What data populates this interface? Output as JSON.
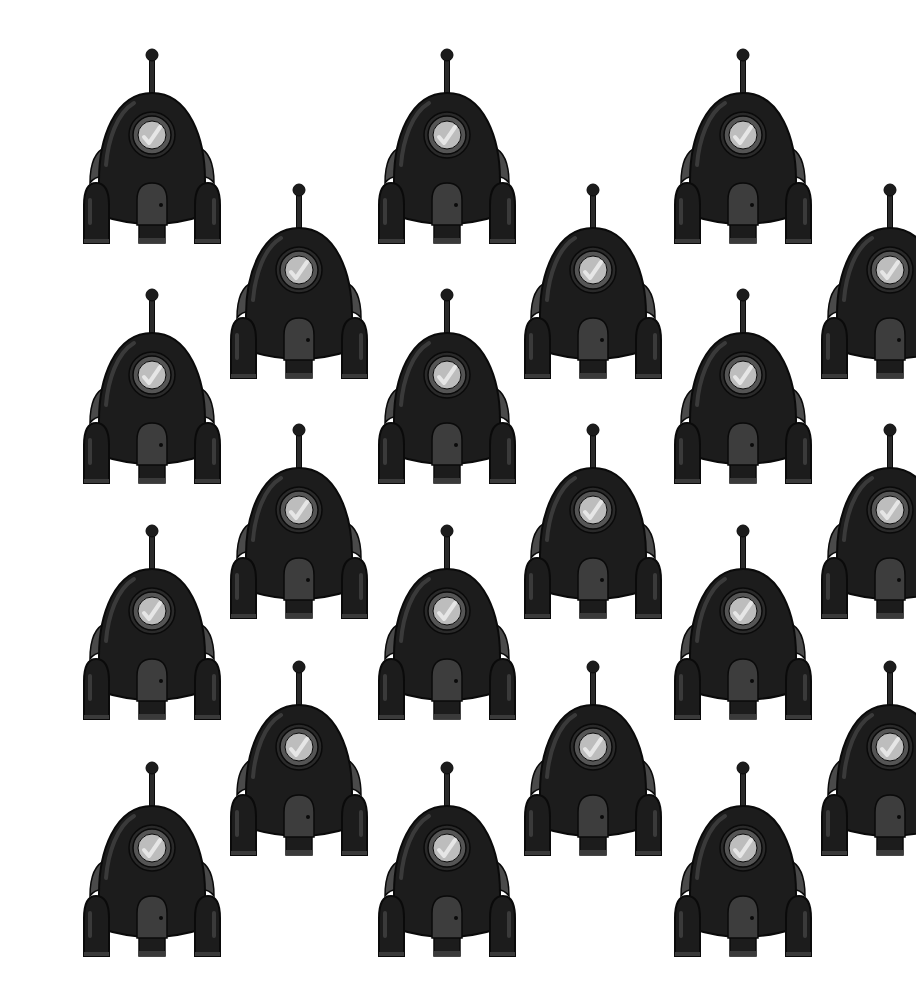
{
  "image": {
    "description": "Repeating pattern of black cartoon rockets on a white background",
    "background": "#ffffff",
    "colors": {
      "body": "#1c1c1c",
      "outline": "#0a0a0a",
      "highlight": "#3a3a3a",
      "fin": "#4a4a4a",
      "door": "#3d3d3d",
      "porthole_ring": "#555555",
      "porthole_glass": "#bdbdbd",
      "glass_shine": "#e6e6e6"
    }
  },
  "rockets": [
    {
      "id": "rocket-a1",
      "x": 77,
      "y": 45
    },
    {
      "id": "rocket-a2",
      "x": 372,
      "y": 45
    },
    {
      "id": "rocket-a3",
      "x": 668,
      "y": 45
    },
    {
      "id": "rocket-b1",
      "x": 224,
      "y": 180
    },
    {
      "id": "rocket-b2",
      "x": 518,
      "y": 180
    },
    {
      "id": "rocket-b3",
      "x": 815,
      "y": 180
    },
    {
      "id": "rocket-a4",
      "x": 77,
      "y": 285
    },
    {
      "id": "rocket-a5",
      "x": 372,
      "y": 285
    },
    {
      "id": "rocket-a6",
      "x": 668,
      "y": 285
    },
    {
      "id": "rocket-b4",
      "x": 224,
      "y": 420
    },
    {
      "id": "rocket-b5",
      "x": 518,
      "y": 420
    },
    {
      "id": "rocket-b6",
      "x": 815,
      "y": 420
    },
    {
      "id": "rocket-a7",
      "x": 77,
      "y": 521
    },
    {
      "id": "rocket-a8",
      "x": 372,
      "y": 521
    },
    {
      "id": "rocket-a9",
      "x": 668,
      "y": 521
    },
    {
      "id": "rocket-b7",
      "x": 224,
      "y": 657
    },
    {
      "id": "rocket-b8",
      "x": 518,
      "y": 657
    },
    {
      "id": "rocket-b9",
      "x": 815,
      "y": 657
    },
    {
      "id": "rocket-a10",
      "x": 77,
      "y": 758
    },
    {
      "id": "rocket-a11",
      "x": 372,
      "y": 758
    },
    {
      "id": "rocket-a12",
      "x": 668,
      "y": 758
    }
  ]
}
